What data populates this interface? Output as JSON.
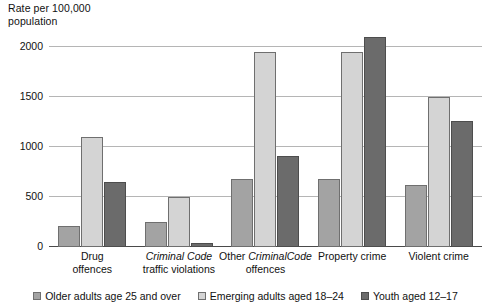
{
  "chart_data": {
    "type": "bar",
    "title": "",
    "subtitle": "",
    "xlabel": "",
    "ylabel": "Rate per 100,000\npopulation",
    "ylim": [
      0,
      2000
    ],
    "yticks": [
      0,
      500,
      1000,
      1500,
      2000
    ],
    "ytick_labels": [
      "0",
      "500",
      "1000",
      "1500",
      "2000"
    ],
    "grid": true,
    "legend_position": "bottom",
    "categories": [
      "Drug offences",
      "Criminal Code traffic violations",
      "Other Criminal Code offences",
      "Property crime",
      "Violent crime"
    ],
    "category_label_parts": [
      [
        {
          "text": "Drug",
          "italic": false
        },
        {
          "text": "offences",
          "italic": false
        }
      ],
      [
        {
          "text": "Criminal Code",
          "italic": true
        },
        {
          "text": "traffic violations",
          "italic": false
        }
      ],
      [
        {
          "text": "Other ",
          "italic": false,
          "inline": true
        },
        {
          "text": "Criminal",
          "italic": true,
          "inline": true
        },
        {
          "text": "Code",
          "italic": true,
          "inline": true
        },
        {
          "text": " offences",
          "italic": false,
          "inline": true
        }
      ],
      [
        {
          "text": "Property crime",
          "italic": false
        }
      ],
      [
        {
          "text": "Violent crime",
          "italic": false
        }
      ]
    ],
    "series": [
      {
        "name": "Older adults age 25 and over",
        "color": "#a3a3a3",
        "values": [
          215,
          255,
          685,
          680,
          625
        ]
      },
      {
        "name": "Emerging adults aged 18–24",
        "color": "#d4d4d4",
        "values": [
          1105,
          500,
          1950,
          1950,
          1505
        ]
      },
      {
        "name": "Youth aged 12–17",
        "color": "#6b6b6b",
        "values": [
          655,
          45,
          915,
          2100,
          1260
        ]
      }
    ]
  },
  "legend": {
    "items": [
      {
        "label": "Older adults age 25 and over",
        "swatch": "s0"
      },
      {
        "label": "Emerging adults aged 18–24",
        "swatch": "s1"
      },
      {
        "label": "Youth aged 12–17",
        "swatch": "s2"
      }
    ]
  },
  "colors": {
    "series_older_adults": "#a3a3a3",
    "series_emerging_adults": "#d4d4d4",
    "series_youth": "#6b6b6b",
    "gridline": "#b5b5b5",
    "axis": "#4a4a4a",
    "text": "#111111",
    "background": "#ffffff"
  }
}
